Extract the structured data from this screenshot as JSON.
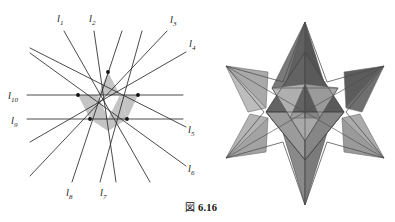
{
  "figure": {
    "caption_prefix": "図",
    "caption_number": "6.16",
    "caption_full": "図 6.16"
  },
  "line_diagram": {
    "name": "line-arrangement-hexagram",
    "description": "Arrangement of ten labeled straight lines meeting in a hexagram configuration with shaded central triangles",
    "line_color": "#2b2b2b",
    "shade_color": "#c3c3c3",
    "node_color": "#111111",
    "labels": [
      {
        "id": "l1",
        "text": "l",
        "sub": "1",
        "x": 57,
        "y": 22
      },
      {
        "id": "l2",
        "text": "l",
        "sub": "2",
        "x": 89,
        "y": 22
      },
      {
        "id": "l3",
        "text": "l",
        "sub": "3",
        "x": 170,
        "y": 23
      },
      {
        "id": "l4",
        "text": "l",
        "sub": "4",
        "x": 189,
        "y": 47
      },
      {
        "id": "l5",
        "text": "l",
        "sub": "5",
        "x": 188,
        "y": 129
      },
      {
        "id": "l6",
        "text": "l",
        "sub": "6",
        "x": 188,
        "y": 168
      },
      {
        "id": "l7",
        "text": "l",
        "sub": "7",
        "x": 100,
        "y": 193
      },
      {
        "id": "l8",
        "text": "l",
        "sub": "8",
        "x": 67,
        "y": 193
      },
      {
        "id": "l9",
        "text": "l",
        "sub": "9",
        "x": 14,
        "y": 125
      },
      {
        "id": "l10",
        "text": "l",
        "sub": "10",
        "x": 12,
        "y": 89
      }
    ]
  },
  "polyhedron": {
    "name": "stella-octangula",
    "description": "Compound of two tetrahedra (stellated octahedron) shown in grayscale shading",
    "palette": {
      "dark": "#585858",
      "mid_dark": "#6e6e6e",
      "mid": "#8d8d8d",
      "light": "#a8a8a8",
      "lighter": "#bdbdbd",
      "lightest": "#d2d2d2",
      "edge": "#4a4a4a"
    }
  }
}
